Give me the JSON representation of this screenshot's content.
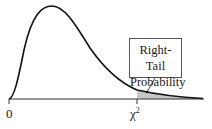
{
  "diagram": {
    "type": "chi-square distribution density curve",
    "x_origin_label": "0",
    "critical_value_label": "χ",
    "critical_value_superscript": "2",
    "callout": {
      "line1": "Right-Tail",
      "line2": "Probability"
    },
    "shaded_region": "right tail beyond χ²",
    "colors": {
      "curve": "#111111",
      "axis": "#333333",
      "shade": "#c8c8c8"
    }
  }
}
